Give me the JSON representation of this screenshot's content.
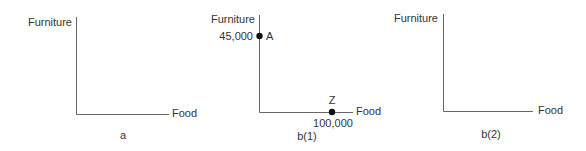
{
  "panels": [
    {
      "caption": "a",
      "y_axis_label": "Furniture",
      "x_axis_label": "Food",
      "points": []
    },
    {
      "caption": "b(1)",
      "y_axis_label": "Furniture",
      "x_axis_label": "Food",
      "points": [
        {
          "name": "A",
          "value_label": "45,000",
          "axis": "Furniture",
          "x": 0,
          "y": 45000
        },
        {
          "name": "Z",
          "value_label": "100,000",
          "axis": "Food",
          "x": 100000,
          "y": 0
        }
      ]
    },
    {
      "caption": "b(2)",
      "y_axis_label": "Furniture",
      "x_axis_label": "Food",
      "points": []
    }
  ],
  "colors": {
    "axis": "#555555",
    "point": "#111111",
    "text": "#333333"
  }
}
